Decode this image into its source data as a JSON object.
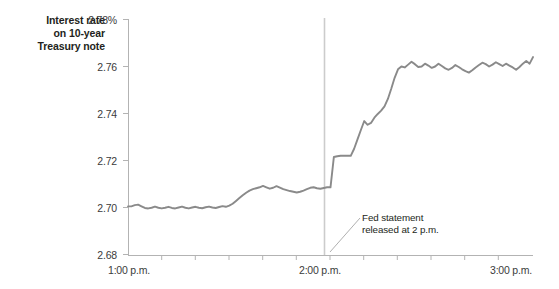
{
  "chart_data": {
    "type": "line",
    "title": "Interest rate on 10-year Treasury note",
    "title_lines": [
      "Interest rate",
      "on 10-year",
      "Treasury note"
    ],
    "xlabel": "",
    "ylabel": "Interest rate on 10-year Treasury note",
    "ylim": [
      2.68,
      2.78
    ],
    "xlim": [
      0,
      120
    ],
    "grid": false,
    "legend": "none",
    "line_color": "#8a8a8a",
    "axis_color": "#b3b3b3",
    "event_line_color": "#cccccc",
    "y_ticks": [
      {
        "value": 2.78,
        "label": "2.78%"
      },
      {
        "value": 2.76,
        "label": "2.76"
      },
      {
        "value": 2.74,
        "label": "2.74"
      },
      {
        "value": 2.72,
        "label": "2.72"
      },
      {
        "value": 2.7,
        "label": "2.70"
      },
      {
        "value": 2.68,
        "label": "2.68"
      }
    ],
    "x_ticks_major": [
      {
        "value": 0,
        "label": "1:00 p.m."
      },
      {
        "value": 60,
        "label": "2:00 p.m."
      },
      {
        "value": 120,
        "label": "3:00 p.m."
      }
    ],
    "x_ticks_minor": [
      10,
      20,
      30,
      40,
      50,
      70,
      80,
      90,
      100,
      110
    ],
    "annotations": [
      {
        "name": "fed-statement-annotation",
        "lines": [
          "Fed statement",
          "released at 2 p.m."
        ],
        "x": 60,
        "y": 2.6895
      }
    ],
    "event_marker": {
      "x": 60,
      "label": "2 p.m. Fed statement"
    },
    "x": [
      0,
      1,
      2,
      3,
      4,
      5,
      6,
      7,
      8,
      9,
      10,
      11,
      12,
      13,
      14,
      15,
      16,
      17,
      18,
      19,
      20,
      21,
      22,
      23,
      24,
      25,
      26,
      27,
      28,
      29,
      30,
      31,
      32,
      33,
      34,
      35,
      36,
      37,
      38,
      39,
      40,
      41,
      42,
      43,
      44,
      45,
      46,
      47,
      48,
      49,
      50,
      51,
      52,
      53,
      54,
      55,
      56,
      57,
      58,
      59,
      60,
      61,
      62,
      63,
      64,
      65,
      66,
      67,
      68,
      69,
      70,
      71,
      72,
      73,
      74,
      75,
      76,
      77,
      78,
      79,
      80,
      81,
      82,
      83,
      84,
      85,
      86,
      87,
      88,
      89,
      90,
      91,
      92,
      93,
      94,
      95,
      96,
      97,
      98,
      99,
      100,
      101,
      102,
      103,
      104,
      105,
      106,
      107,
      108,
      109,
      110,
      111,
      112,
      113,
      114,
      115,
      116,
      117,
      118,
      119,
      120
    ],
    "y": [
      2.7005,
      2.7005,
      2.701,
      2.7012,
      2.7005,
      2.6998,
      2.6996,
      2.6999,
      2.7004,
      2.6999,
      2.6996,
      2.6999,
      2.7003,
      2.6998,
      2.6996,
      2.7,
      2.7004,
      2.6999,
      2.6996,
      2.7,
      2.7003,
      2.6999,
      2.6997,
      2.7001,
      2.7004,
      2.7,
      2.6998,
      2.7002,
      2.7006,
      2.7003,
      2.7008,
      2.7016,
      2.7028,
      2.704,
      2.7052,
      2.7063,
      2.7072,
      2.7078,
      2.7082,
      2.7086,
      2.7092,
      2.7086,
      2.708,
      2.7084,
      2.7091,
      2.7085,
      2.7078,
      2.7074,
      2.707,
      2.7067,
      2.7064,
      2.7067,
      2.7072,
      2.7078,
      2.7084,
      2.7086,
      2.7082,
      2.708,
      2.7083,
      2.7086,
      2.7086,
      2.7215,
      2.7218,
      2.722,
      2.722,
      2.722,
      2.722,
      2.725,
      2.729,
      2.733,
      2.7368,
      2.7352,
      2.736,
      2.7382,
      2.7398,
      2.7412,
      2.743,
      2.7462,
      2.7505,
      2.7552,
      2.7588,
      2.76,
      2.7596,
      2.7608,
      2.762,
      2.761,
      2.7598,
      2.76,
      2.7612,
      2.7604,
      2.7594,
      2.76,
      2.7612,
      2.7602,
      2.7592,
      2.7586,
      2.7594,
      2.7606,
      2.7598,
      2.7588,
      2.758,
      2.7574,
      2.7584,
      2.7596,
      2.7606,
      2.7616,
      2.761,
      2.76,
      2.7608,
      2.7618,
      2.761,
      2.7602,
      2.7612,
      2.7604,
      2.7596,
      2.7586,
      2.7598,
      2.7612,
      2.7624,
      2.7612,
      2.764,
      2.7662
    ]
  }
}
